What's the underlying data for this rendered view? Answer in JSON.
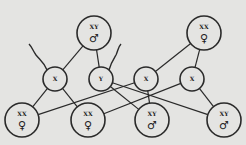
{
  "diagram": {
    "title": "",
    "parents": [
      {
        "id": "father",
        "label": "XY",
        "sex_symbol": "♂",
        "x": 94,
        "y": 33,
        "r": 17
      },
      {
        "id": "mother",
        "label": "XX",
        "sex_symbol": "♀",
        "x": 204,
        "y": 33,
        "r": 17
      }
    ],
    "gametes": [
      {
        "id": "g1",
        "label": "X",
        "parent": "father",
        "x": 55,
        "y": 79,
        "r": 12
      },
      {
        "id": "g2",
        "label": "Y",
        "parent": "father",
        "x": 101,
        "y": 79,
        "r": 12
      },
      {
        "id": "g3",
        "label": "X",
        "parent": "mother",
        "x": 146,
        "y": 79,
        "r": 12
      },
      {
        "id": "g4",
        "label": "X",
        "parent": "mother",
        "x": 192,
        "y": 79,
        "r": 12
      }
    ],
    "offspring": [
      {
        "id": "o1",
        "label": "XX",
        "sex_symbol": "♀",
        "x": 22,
        "y": 120,
        "r": 17
      },
      {
        "id": "o2",
        "label": "XX",
        "sex_symbol": "♀",
        "x": 88,
        "y": 120,
        "r": 17
      },
      {
        "id": "o3",
        "label": "XY",
        "sex_symbol": "♂",
        "x": 152,
        "y": 120,
        "r": 17
      },
      {
        "id": "o4",
        "label": "XY",
        "sex_symbol": "♂",
        "x": 224,
        "y": 120,
        "r": 17
      }
    ],
    "edges": [
      [
        "father",
        "g1"
      ],
      [
        "father",
        "g2"
      ],
      [
        "mother",
        "g3"
      ],
      [
        "mother",
        "g4"
      ],
      [
        "g1",
        "o1"
      ],
      [
        "g1",
        "o2"
      ],
      [
        "g2",
        "o3"
      ],
      [
        "g2",
        "o4"
      ],
      [
        "g3",
        "o1"
      ],
      [
        "g3",
        "o3"
      ],
      [
        "g4",
        "o2"
      ],
      [
        "g4",
        "o4"
      ]
    ]
  }
}
